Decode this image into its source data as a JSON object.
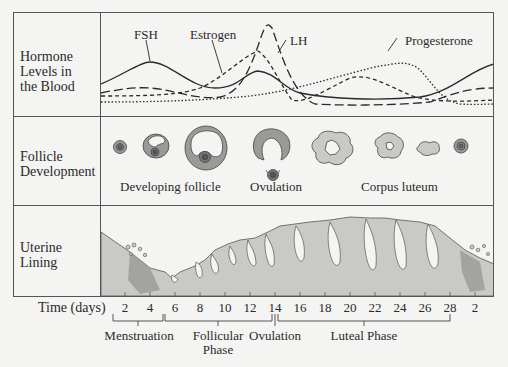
{
  "rows": {
    "hormone": {
      "label_lines": [
        "Hormone",
        "Levels in",
        "the Blood"
      ]
    },
    "follicle": {
      "label_lines": [
        "Follicle",
        "Development"
      ]
    },
    "uterine": {
      "label_lines": [
        "Uterine",
        "Lining"
      ]
    }
  },
  "hormone_labels": {
    "fsh": "FSH",
    "estrogen": "Estrogen",
    "lh": "LH",
    "progesterone": "Progesterone"
  },
  "follicle_labels": {
    "developing": "Developing follicle",
    "ovulation": "Ovulation",
    "corpus_luteum": "Corpus luteum"
  },
  "axis": {
    "title": "Time (days)",
    "ticks": [
      "2",
      "4",
      "6",
      "8",
      "10",
      "12",
      "14",
      "16",
      "18",
      "20",
      "22",
      "24",
      "26",
      "28",
      "2"
    ]
  },
  "phases": {
    "menstruation": "Menstruation",
    "follicular_1": "Follicular",
    "follicular_2": "Phase",
    "ovulation": "Ovulation",
    "luteal": "Luteal Phase"
  },
  "colors": {
    "line": "#2a2a2a",
    "tissue_light": "#c9c9c7",
    "tissue_dark": "#9a9a98",
    "background": "#f4f4f2"
  }
}
